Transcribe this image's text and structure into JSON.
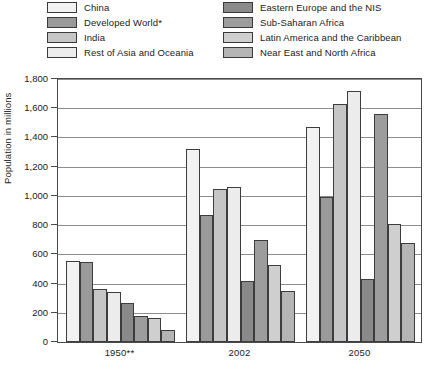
{
  "chart_data": {
    "type": "bar",
    "title": "",
    "xlabel": "",
    "ylabel": "Population in millions",
    "ylim": [
      0,
      1800
    ],
    "ytick_step": 200,
    "grid": true,
    "legend_position": "top",
    "categories": [
      "1950**",
      "2002",
      "2050"
    ],
    "ytick_labels": [
      "0",
      "200",
      "400",
      "600",
      "800",
      "1,000",
      "1,200",
      "1,400",
      "1,600",
      "1,800"
    ],
    "series": [
      {
        "name": "China",
        "color": "#f2f2f2",
        "values": [
          555,
          1320,
          1470
        ]
      },
      {
        "name": "Developed World*",
        "color": "#9a9a9a",
        "values": [
          545,
          870,
          990
        ]
      },
      {
        "name": "India",
        "color": "#c6c6c6",
        "values": [
          360,
          1050,
          1630
        ]
      },
      {
        "name": "Rest of Asia and Oceania",
        "color": "#ececec",
        "values": [
          345,
          1060,
          1720
        ]
      },
      {
        "name": "Eastern Europe and the NIS",
        "color": "#8a8a8a",
        "values": [
          265,
          420,
          430
        ]
      },
      {
        "name": "Sub-Saharan Africa",
        "color": "#9d9d9d",
        "values": [
          180,
          700,
          1560
        ]
      },
      {
        "name": "Latin America and the Caribbean",
        "color": "#cfcfcf",
        "values": [
          165,
          530,
          810
        ]
      },
      {
        "name": "Near East and North Africa",
        "color": "#b5b5b5",
        "values": [
          85,
          350,
          680
        ]
      }
    ]
  },
  "legend": {
    "left_column": [
      {
        "label": "China",
        "color": "#f2f2f2"
      },
      {
        "label": "Developed World*",
        "color": "#9a9a9a"
      },
      {
        "label": "India",
        "color": "#c6c6c6"
      },
      {
        "label": "Rest of Asia and Oceania",
        "color": "#ececec"
      }
    ],
    "right_column": [
      {
        "label": "Eastern Europe and the NIS",
        "color": "#8a8a8a"
      },
      {
        "label": "Sub-Saharan Africa",
        "color": "#9d9d9d"
      },
      {
        "label": "Latin America and the Caribbean",
        "color": "#cfcfcf"
      },
      {
        "label": "Near East and North Africa",
        "color": "#b5b5b5"
      }
    ]
  }
}
